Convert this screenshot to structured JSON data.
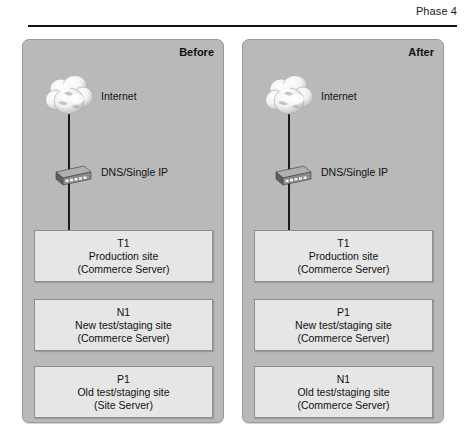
{
  "header": {
    "phase_label": "Phase 4"
  },
  "panels": [
    {
      "id": "before",
      "title": "Before",
      "cloud_label": "Internet",
      "cloud_icon": "cloud-icon",
      "router_label": "DNS/Single IP",
      "router_icon": "network-switch-icon",
      "servers": [
        {
          "name": "T1",
          "role": "Production site",
          "product": "(Commerce Server)"
        },
        {
          "name": "N1",
          "role": "New test/staging site",
          "product": "(Commerce Server)"
        },
        {
          "name": "P1",
          "role": "Old test/staging site",
          "product": "(Site Server)"
        }
      ]
    },
    {
      "id": "after",
      "title": "After",
      "cloud_label": "Internet",
      "cloud_icon": "cloud-icon",
      "router_label": "DNS/Single IP",
      "router_icon": "network-switch-icon",
      "servers": [
        {
          "name": "T1",
          "role": "Production site",
          "product": "(Commerce Server)"
        },
        {
          "name": "P1",
          "role": "New test/staging site",
          "product": "(Commerce Server)"
        },
        {
          "name": "N1",
          "role": "Old test/staging site",
          "product": "(Commerce Server)"
        }
      ]
    }
  ],
  "colors": {
    "panel_fill": "#b9b9b9",
    "box_fill": "#e6e6e6",
    "line": "#1b1b1b",
    "text": "#111111"
  }
}
